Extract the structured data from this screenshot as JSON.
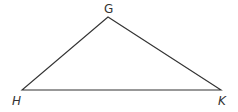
{
  "diagram": {
    "type": "triangle",
    "stroke_color": "#333333",
    "vertices": [
      {
        "name": "G",
        "x": 108,
        "y": 17,
        "label_x": 104,
        "label_y": 13,
        "italic": false
      },
      {
        "name": "H",
        "x": 22,
        "y": 90,
        "label_x": 12,
        "label_y": 105,
        "italic": true
      },
      {
        "name": "K",
        "x": 221,
        "y": 90,
        "label_x": 218,
        "label_y": 105,
        "italic": true
      }
    ],
    "labels": {
      "g": "G",
      "h": "H",
      "k": "K"
    }
  }
}
